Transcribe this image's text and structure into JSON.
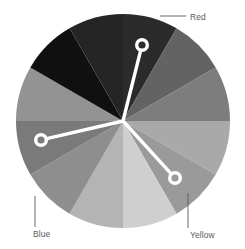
{
  "widget": {
    "name": "color-wheel-picker",
    "background": "#ffffff",
    "rendering": "grayscale"
  },
  "wheel": {
    "center_x": 123,
    "center_y": 121,
    "radius": 107,
    "segment_count": 12,
    "segment_span_degrees": 30,
    "segments": [
      {
        "index": 0,
        "start_angle": -90,
        "end_angle": -60,
        "color": "#2b2b2b"
      },
      {
        "index": 1,
        "start_angle": -60,
        "end_angle": -30,
        "color": "#636363"
      },
      {
        "index": 2,
        "start_angle": -30,
        "end_angle": 0,
        "color": "#7d7d7d"
      },
      {
        "index": 3,
        "start_angle": 0,
        "end_angle": 30,
        "color": "#a9a9a9"
      },
      {
        "index": 4,
        "start_angle": 30,
        "end_angle": 60,
        "color": "#9a9a9a"
      },
      {
        "index": 5,
        "start_angle": 60,
        "end_angle": 90,
        "color": "#cfcfcf"
      },
      {
        "index": 6,
        "start_angle": 90,
        "end_angle": 120,
        "color": "#b4b4b4"
      },
      {
        "index": 7,
        "start_angle": 120,
        "end_angle": 150,
        "color": "#8e8e8e"
      },
      {
        "index": 8,
        "start_angle": 150,
        "end_angle": 180,
        "color": "#7a7a7a"
      },
      {
        "index": 9,
        "start_angle": 180,
        "end_angle": 210,
        "color": "#939393"
      },
      {
        "index": 10,
        "start_angle": 210,
        "end_angle": 240,
        "color": "#101010"
      },
      {
        "index": 11,
        "start_angle": 240,
        "end_angle": 270,
        "color": "#252525"
      }
    ]
  },
  "handles": [
    {
      "id": "handle-red",
      "label": "Red",
      "x": 142,
      "y": 45,
      "ring_radius": 7,
      "stroke_width": 3.4,
      "color": "#ffffff"
    },
    {
      "id": "handle-blue",
      "label": "Blue",
      "x": 41,
      "y": 140,
      "ring_radius": 7,
      "stroke_width": 3.4,
      "color": "#ffffff"
    },
    {
      "id": "handle-yellow",
      "label": "Yellow",
      "x": 175,
      "y": 178,
      "ring_radius": 7,
      "stroke_width": 3.4,
      "color": "#ffffff"
    }
  ],
  "labels": {
    "red": {
      "text": "Red",
      "leader": {
        "x1": 160,
        "y1": 16,
        "x2": 186,
        "y2": 16
      },
      "color": "#5a5a5a"
    },
    "blue": {
      "text": "Blue",
      "leader": {
        "x1": 35,
        "y1": 196,
        "x2": 35,
        "y2": 227
      },
      "color": "#5a5a5a"
    },
    "yellow": {
      "text": "Yellow",
      "leader": {
        "x1": 188,
        "y1": 193,
        "x2": 188,
        "y2": 228
      },
      "color": "#5a5a5a"
    }
  }
}
